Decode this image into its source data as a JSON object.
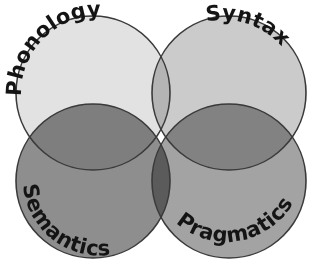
{
  "diagram": {
    "type": "venn",
    "background_color": "#ffffff",
    "outline_color": "#3a3a3a",
    "label_color": "#141414",
    "sets": [
      {
        "id": "phonology",
        "label": "Phonology",
        "position": "top-left",
        "fill_color": "#e2e2e2",
        "cx": 93,
        "cy": 93,
        "r": 77
      },
      {
        "id": "syntax",
        "label": "Syntax",
        "position": "top-right",
        "fill_color": "#cbcbcb",
        "cx": 229,
        "cy": 93,
        "r": 77
      },
      {
        "id": "semantics",
        "label": "Semantics",
        "position": "bottom-left",
        "fill_color": "#8e8e8e",
        "cx": 93,
        "cy": 181,
        "r": 77
      },
      {
        "id": "pragmatics",
        "label": "Pragmatics",
        "position": "bottom-right",
        "fill_color": "#a3a3a3",
        "cx": 229,
        "cy": 181,
        "r": 77
      }
    ],
    "overlap_colors": {
      "top_pair": "#b4b4b4",
      "left_pair": "#808080",
      "right_pair": "#909090",
      "bottom_pair": "#8a8a8a",
      "center_all": "#4a4a4a"
    }
  }
}
